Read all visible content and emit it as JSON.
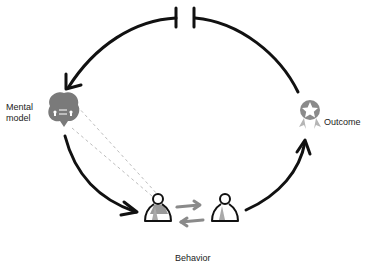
{
  "diagram": {
    "type": "feedback-loop",
    "nodes": [
      {
        "id": "mental_model",
        "label": "Mental model",
        "label_lines": [
          "Mental",
          "model"
        ],
        "icon": "brain-icon"
      },
      {
        "id": "behavior",
        "label": "Behavior",
        "icon": "people-exchange-icon"
      },
      {
        "id": "outcome",
        "label": "Outcome",
        "icon": "award-ribbon-icon"
      }
    ],
    "edges": [
      {
        "from": "mental_model",
        "to": "behavior",
        "style": "solid-curved-arrow"
      },
      {
        "from": "behavior",
        "to": "outcome",
        "style": "solid-curved-arrow"
      },
      {
        "from": "outcome",
        "to": "mental_model",
        "style": "solid-curved-arrow-with-break"
      },
      {
        "from": "mental_model",
        "to": "behavior",
        "style": "dashed-projection"
      }
    ],
    "colors": {
      "stroke": "#111111",
      "icon_gray": "#7a7a7a",
      "dashed": "#bdbdbd",
      "exchange_arrow": "#8a8a8a"
    }
  }
}
